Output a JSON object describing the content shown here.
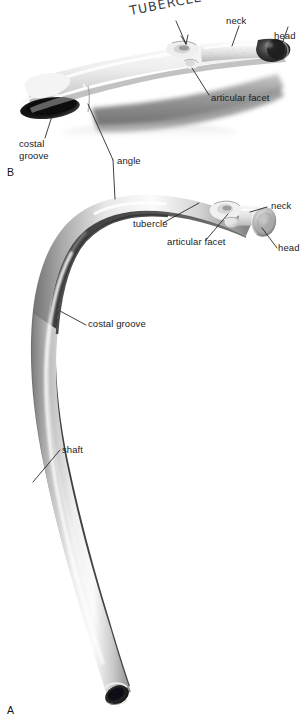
{
  "figure": {
    "background_color": "#ffffff",
    "label_color": "#1b1b1b",
    "leader_color": "#1d1d1d",
    "handwriting_color": "#3c3c46"
  },
  "panels": [
    {
      "id": "panel-a",
      "letter": "A",
      "caption": "lateral view of a typical rib"
    },
    {
      "id": "panel-b",
      "letter": "B",
      "caption": "superior view of a typical rib"
    }
  ],
  "annotations": {
    "handwritten": {
      "text": "TUBERCLE",
      "style": "handwritten-uppercase"
    },
    "panel_b": [
      {
        "name": "neck",
        "text": "neck"
      },
      {
        "name": "head",
        "text": "head"
      },
      {
        "name": "articular-facet",
        "text": "articular facet"
      },
      {
        "name": "costal-groove",
        "text": "costal\ngroove"
      }
    ],
    "shared": [
      {
        "name": "angle",
        "text": "angle"
      }
    ],
    "panel_a": [
      {
        "name": "tubercle",
        "text": "tubercle"
      },
      {
        "name": "articular-facet",
        "text": "articular facet"
      },
      {
        "name": "neck",
        "text": "neck"
      },
      {
        "name": "head",
        "text": "head"
      },
      {
        "name": "costal-groove",
        "text": "costal groove"
      },
      {
        "name": "shaft",
        "text": "shaft"
      }
    ]
  }
}
